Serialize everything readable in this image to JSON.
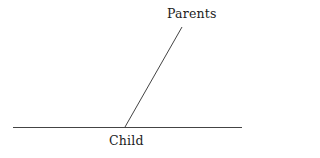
{
  "figure": {
    "title": "",
    "background_color": "#ffffff",
    "line_color": "#444444",
    "text_color": "#1c1c1c",
    "labels": {
      "parents": "Parents",
      "child": "Child"
    }
  },
  "chart_data": {
    "type": "diagram",
    "title": "",
    "elements": [
      {
        "name": "baseline",
        "kind": "line",
        "x1": 13,
        "y1": 127,
        "x2": 242,
        "y2": 127,
        "color": "#444444",
        "width": 1
      },
      {
        "name": "parents-ray",
        "kind": "line",
        "x1": 125,
        "y1": 127,
        "x2": 182,
        "y2": 27,
        "color": "#444444",
        "width": 1
      }
    ],
    "annotations": [
      {
        "name": "parents-label",
        "text": "Parents",
        "x": 167,
        "y": 18
      },
      {
        "name": "child-label",
        "text": "Child",
        "x": 109,
        "y": 145
      }
    ],
    "vertex": {
      "x": 125,
      "y": 127
    },
    "xlim": [
      0,
      249
    ],
    "ylim": [
      0,
      158
    ],
    "grid": false,
    "legend": null
  }
}
